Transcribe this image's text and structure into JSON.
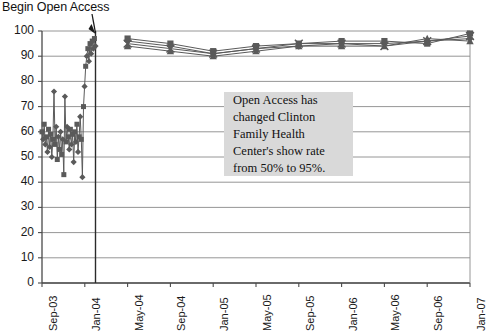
{
  "annotation_title": "Begin Open Access",
  "callout": {
    "lines": [
      "Open Access has",
      "changed Clinton",
      "Family Health",
      "Center's show rate",
      "from 50% to 95%."
    ]
  },
  "colors": {
    "gridline": "#8a8a8a",
    "axis": "#4a4a4a",
    "series": "#5a5a5a",
    "callout_bg": "#d9d9d9",
    "text": "#111111"
  },
  "chart_data": {
    "type": "line",
    "title": "Begin Open Access",
    "xlabel": "",
    "ylabel": "",
    "ylim": [
      0,
      100
    ],
    "ytick_step": 10,
    "ytick_labels": [
      "0",
      "10",
      "20",
      "30",
      "40",
      "50",
      "60",
      "70",
      "80",
      "90",
      "100"
    ],
    "grid": true,
    "legend": "none",
    "annotations": [
      {
        "type": "vline",
        "label": "Begin Open Access",
        "x_category": "Feb-04",
        "note": "vertical intervention line spanning full plot height"
      },
      {
        "type": "arrow",
        "text": "Begin Open Access",
        "points_to": "vline top"
      },
      {
        "type": "textbox",
        "text": "Open Access has changed Clinton Family Health Center's show rate from 50% to 95%."
      }
    ],
    "xtick_labels": [
      "Sep-03",
      "Jan-04",
      "May-04",
      "Sep-04",
      "Jan-05",
      "May-05",
      "Sep-05",
      "Jan-06",
      "May-06",
      "Sep-06",
      "Jan-07"
    ],
    "x_monthly": [
      "Sep-03",
      "Oct-03",
      "Nov-03",
      "Dec-03",
      "Jan-04",
      "Feb-04",
      "Mar-04",
      "Apr-04",
      "May-04",
      "Jun-04",
      "Jul-04",
      "Aug-04",
      "Sep-04",
      "Oct-04",
      "Nov-04",
      "Dec-04",
      "Jan-05",
      "Feb-05",
      "Mar-05",
      "Apr-05",
      "May-05",
      "Jun-05",
      "Jul-05",
      "Aug-05",
      "Sep-05",
      "Oct-05",
      "Nov-05",
      "Dec-05",
      "Jan-06",
      "Feb-06",
      "Mar-06",
      "Apr-06",
      "May-06",
      "Jun-06",
      "Jul-06",
      "Aug-06",
      "Sep-06",
      "Oct-06",
      "Nov-06",
      "Dec-06",
      "Jan-07"
    ],
    "series": [
      {
        "name": "Show rate A",
        "marker": "diamond",
        "weekly_pre": [
          {
            "t": 0.0,
            "v": 60
          },
          {
            "t": 0.35,
            "v": 57
          },
          {
            "t": 0.7,
            "v": 63
          },
          {
            "t": 1.05,
            "v": 55
          },
          {
            "t": 1.4,
            "v": 58
          },
          {
            "t": 1.75,
            "v": 52
          },
          {
            "t": 2.1,
            "v": 61
          },
          {
            "t": 2.45,
            "v": 54
          },
          {
            "t": 2.8,
            "v": 59
          },
          {
            "t": 3.15,
            "v": 50
          },
          {
            "t": 3.5,
            "v": 57
          },
          {
            "t": 3.85,
            "v": 76
          },
          {
            "t": 4.2,
            "v": 55
          },
          {
            "t": 4.55,
            "v": 62
          },
          {
            "t": 4.9,
            "v": 49
          },
          {
            "t": 5.25,
            "v": 58
          },
          {
            "t": 5.6,
            "v": 53
          },
          {
            "t": 5.95,
            "v": 60
          },
          {
            "t": 6.3,
            "v": 51
          },
          {
            "t": 6.65,
            "v": 57
          },
          {
            "t": 7.0,
            "v": 43
          },
          {
            "t": 7.35,
            "v": 74
          },
          {
            "t": 7.7,
            "v": 56
          },
          {
            "t": 8.05,
            "v": 62
          },
          {
            "t": 8.4,
            "v": 58
          },
          {
            "t": 8.75,
            "v": 53
          },
          {
            "t": 9.1,
            "v": 61
          },
          {
            "t": 9.45,
            "v": 55
          },
          {
            "t": 9.8,
            "v": 59
          },
          {
            "t": 10.15,
            "v": 48
          },
          {
            "t": 10.5,
            "v": 60
          },
          {
            "t": 10.85,
            "v": 56
          },
          {
            "t": 11.2,
            "v": 63
          },
          {
            "t": 11.55,
            "v": 52
          },
          {
            "t": 11.9,
            "v": 58
          },
          {
            "t": 12.25,
            "v": 66
          },
          {
            "t": 12.6,
            "v": 57
          },
          {
            "t": 12.95,
            "v": 42
          },
          {
            "t": 13.3,
            "v": 70
          },
          {
            "t": 13.65,
            "v": 78
          },
          {
            "t": 14.0,
            "v": 86
          },
          {
            "t": 14.35,
            "v": 90
          },
          {
            "t": 14.7,
            "v": 93
          },
          {
            "t": 15.05,
            "v": 88
          },
          {
            "t": 15.4,
            "v": 95
          },
          {
            "t": 15.75,
            "v": 91
          },
          {
            "t": 16.1,
            "v": 96
          },
          {
            "t": 16.45,
            "v": 93
          },
          {
            "t": 16.8,
            "v": 97
          },
          {
            "t": 17.15,
            "v": 94
          }
        ],
        "post_monthly": [
          {
            "x": "May-04",
            "v": 96
          },
          {
            "x": "Sep-04",
            "v": 94
          },
          {
            "x": "Jan-05",
            "v": 91
          },
          {
            "x": "May-05",
            "v": 93
          },
          {
            "x": "Sep-05",
            "v": 94
          },
          {
            "x": "Jan-06",
            "v": 95
          },
          {
            "x": "May-06",
            "v": 95
          },
          {
            "x": "Sep-06",
            "v": 96
          },
          {
            "x": "Jan-07",
            "v": 97
          }
        ]
      },
      {
        "name": "Show rate B",
        "marker": "square",
        "post_monthly": [
          {
            "x": "May-04",
            "v": 97
          },
          {
            "x": "Sep-04",
            "v": 95
          },
          {
            "x": "Jan-05",
            "v": 92
          },
          {
            "x": "May-05",
            "v": 94
          },
          {
            "x": "Sep-05",
            "v": 95
          },
          {
            "x": "Jan-06",
            "v": 96
          },
          {
            "x": "May-06",
            "v": 96
          },
          {
            "x": "Sep-06",
            "v": 95
          },
          {
            "x": "Jan-07",
            "v": 99
          }
        ]
      },
      {
        "name": "Show rate C",
        "marker": "triangle",
        "post_monthly": [
          {
            "x": "May-04",
            "v": 94
          },
          {
            "x": "Sep-04",
            "v": 92
          },
          {
            "x": "Jan-05",
            "v": 90
          },
          {
            "x": "May-05",
            "v": 92
          },
          {
            "x": "Sep-05",
            "v": 94
          },
          {
            "x": "Jan-06",
            "v": 94
          },
          {
            "x": "May-06",
            "v": 94
          },
          {
            "x": "Sep-06",
            "v": 97
          },
          {
            "x": "Jan-07",
            "v": 96
          }
        ]
      },
      {
        "name": "Show rate D",
        "marker": "cross",
        "post_monthly": [
          {
            "x": "May-04",
            "v": 95
          },
          {
            "x": "Sep-04",
            "v": 93
          },
          {
            "x": "Jan-05",
            "v": 91
          },
          {
            "x": "May-05",
            "v": 93
          },
          {
            "x": "Sep-05",
            "v": 95
          },
          {
            "x": "Jan-06",
            "v": 95
          },
          {
            "x": "May-06",
            "v": 94
          },
          {
            "x": "Sep-06",
            "v": 96
          },
          {
            "x": "Jan-07",
            "v": 98
          }
        ]
      }
    ]
  }
}
